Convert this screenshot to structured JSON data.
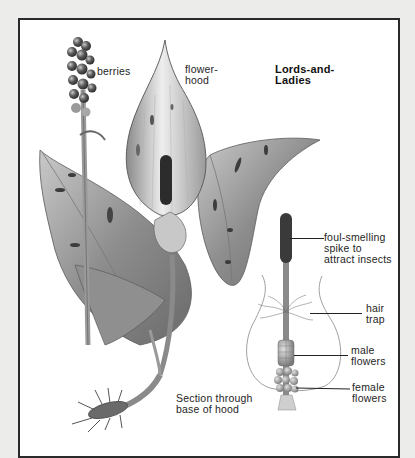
{
  "figure": {
    "title": "Lords-and-\nLadies",
    "colors": {
      "page_background": "#ececea",
      "panel_background": "#ffffff",
      "border": "#2a2a2a",
      "label_text": "#1e1e1e"
    }
  },
  "labels": {
    "berries": "berries",
    "flower_hood": "flower-\nhood",
    "spike": "foul-smelling\nspike to\nattract insects",
    "hair_trap": "hair\ntrap",
    "male_flowers": "male\nflowers",
    "female_flowers": "female\nflowers",
    "section_caption": "Section through\nbase of hood"
  },
  "icons": {
    "plant": "plant-illustration",
    "section": "hood-section-illustration"
  }
}
